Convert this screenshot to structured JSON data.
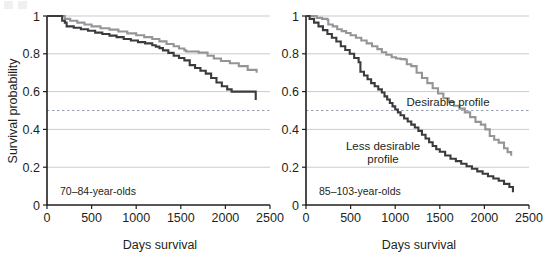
{
  "figure": {
    "title": "",
    "panels": [
      {
        "id": "left",
        "label": "70–84-year-olds",
        "xlabel": "Days survival",
        "ylabel": "Survival probability",
        "xticks": [
          "0",
          "500",
          "1000",
          "1500",
          "2000",
          "2500"
        ],
        "yticks": [
          "0",
          "0.2",
          "0.4",
          "0.6",
          "0.8",
          "1"
        ]
      },
      {
        "id": "right",
        "label": "85–103-year-olds",
        "xlabel": "Days survival",
        "ylabel": "",
        "xticks": [
          "0",
          "500",
          "1000",
          "1500",
          "2000",
          "2500"
        ],
        "yticks": [
          "0",
          "0.2",
          "0.4",
          "0.6",
          "0.8",
          "1"
        ],
        "annotations": [
          {
            "name": "desirable-profile-label",
            "text": "Desirable profile"
          },
          {
            "name": "less-desirable-profile-label-line1",
            "text": "Less desirable"
          },
          {
            "name": "less-desirable-profile-label-line2",
            "text": "profile"
          }
        ]
      }
    ],
    "colors": {
      "desirable": "#939598",
      "less_desirable": "#3b3b3d",
      "gridline": "#bcbec0",
      "reference_line": "#9aa2b1",
      "axis": "#231f20",
      "background": "#ffffff"
    },
    "reference_line_value": 0.5
  },
  "chart_data": [
    {
      "type": "line",
      "subtype": "kaplan-meier-step",
      "panel": "left",
      "title": "70–84-year-olds",
      "xlabel": "Days survival",
      "ylabel": "Survival probability",
      "xlim": [
        0,
        2500
      ],
      "ylim": [
        0,
        1
      ],
      "xticks": [
        0,
        500,
        1000,
        1500,
        2000,
        2500
      ],
      "yticks": [
        0,
        0.2,
        0.4,
        0.6,
        0.8,
        1
      ],
      "grid": "horizontal",
      "legend": "none",
      "reference_line": {
        "y": 0.5,
        "style": "dashed"
      },
      "series": [
        {
          "name": "Desirable profile",
          "color": "#939598",
          "x": [
            0,
            150,
            200,
            260,
            340,
            420,
            500,
            600,
            700,
            800,
            900,
            1000,
            1090,
            1180,
            1260,
            1340,
            1420,
            1480,
            1540,
            1560,
            1700,
            1800,
            1870,
            1950,
            2050,
            2150,
            2250,
            2350
          ],
          "y": [
            1.0,
            1.0,
            0.985,
            0.975,
            0.965,
            0.955,
            0.945,
            0.935,
            0.928,
            0.918,
            0.908,
            0.898,
            0.888,
            0.878,
            0.866,
            0.852,
            0.84,
            0.828,
            0.818,
            0.812,
            0.806,
            0.79,
            0.775,
            0.762,
            0.75,
            0.735,
            0.715,
            0.7
          ]
        },
        {
          "name": "Less desirable profile",
          "color": "#3b3b3d",
          "x": [
            0,
            140,
            170,
            200,
            220,
            300,
            380,
            460,
            540,
            620,
            700,
            780,
            860,
            940,
            1020,
            1100,
            1180,
            1220,
            1260,
            1300,
            1360,
            1420,
            1480,
            1540,
            1600,
            1660,
            1720,
            1780,
            1840,
            1900,
            1960,
            2020,
            2070,
            2300,
            2340
          ],
          "y": [
            1.0,
            1.0,
            0.975,
            0.965,
            0.945,
            0.938,
            0.93,
            0.922,
            0.912,
            0.905,
            0.896,
            0.888,
            0.878,
            0.87,
            0.862,
            0.855,
            0.845,
            0.838,
            0.83,
            0.818,
            0.805,
            0.79,
            0.778,
            0.765,
            0.74,
            0.725,
            0.71,
            0.695,
            0.672,
            0.648,
            0.628,
            0.612,
            0.6,
            0.6,
            0.555
          ]
        }
      ]
    },
    {
      "type": "line",
      "subtype": "kaplan-meier-step",
      "panel": "right",
      "title": "85–103-year-olds",
      "xlabel": "Days survival",
      "ylabel": "",
      "xlim": [
        0,
        2500
      ],
      "ylim": [
        0,
        1
      ],
      "xticks": [
        0,
        500,
        1000,
        1500,
        2000,
        2500
      ],
      "yticks": [
        0,
        0.2,
        0.4,
        0.6,
        0.8,
        1
      ],
      "grid": "horizontal",
      "legend": "inline-annotations",
      "reference_line": {
        "y": 0.5,
        "style": "dashed"
      },
      "series": [
        {
          "name": "Desirable profile",
          "color": "#939598",
          "x": [
            0,
            60,
            120,
            180,
            240,
            250,
            300,
            350,
            400,
            450,
            500,
            560,
            620,
            680,
            740,
            800,
            850,
            900,
            960,
            1010,
            1060,
            1110,
            1130,
            1180,
            1240,
            1300,
            1360,
            1420,
            1480,
            1540,
            1600,
            1660,
            1720,
            1780,
            1840,
            1900,
            1960,
            2010,
            2060,
            2110,
            2160,
            2220,
            2260,
            2300
          ],
          "y": [
            1.0,
            1.0,
            0.99,
            0.985,
            0.98,
            0.955,
            0.945,
            0.93,
            0.92,
            0.91,
            0.898,
            0.885,
            0.87,
            0.855,
            0.84,
            0.825,
            0.808,
            0.795,
            0.782,
            0.775,
            0.772,
            0.77,
            0.745,
            0.735,
            0.7,
            0.672,
            0.645,
            0.618,
            0.59,
            0.565,
            0.545,
            0.525,
            0.51,
            0.49,
            0.465,
            0.44,
            0.425,
            0.4,
            0.365,
            0.345,
            0.33,
            0.3,
            0.28,
            0.26
          ]
        },
        {
          "name": "Less desirable profile",
          "color": "#3b3b3d",
          "x": [
            0,
            40,
            90,
            140,
            190,
            240,
            290,
            340,
            390,
            440,
            490,
            540,
            590,
            610,
            650,
            690,
            730,
            770,
            810,
            850,
            880,
            910,
            940,
            970,
            1000,
            1030,
            1060,
            1100,
            1140,
            1180,
            1220,
            1260,
            1300,
            1340,
            1380,
            1420,
            1460,
            1500,
            1560,
            1620,
            1680,
            1740,
            1800,
            1860,
            1920,
            1980,
            2040,
            2100,
            2160,
            2220,
            2280,
            2320
          ],
          "y": [
            1.0,
            0.985,
            0.965,
            0.945,
            0.925,
            0.905,
            0.885,
            0.865,
            0.84,
            0.82,
            0.8,
            0.778,
            0.755,
            0.705,
            0.685,
            0.665,
            0.645,
            0.628,
            0.612,
            0.595,
            0.575,
            0.558,
            0.54,
            0.522,
            0.505,
            0.49,
            0.475,
            0.458,
            0.442,
            0.425,
            0.41,
            0.392,
            0.372,
            0.352,
            0.332,
            0.312,
            0.295,
            0.282,
            0.262,
            0.245,
            0.232,
            0.218,
            0.205,
            0.192,
            0.178,
            0.165,
            0.152,
            0.14,
            0.128,
            0.112,
            0.095,
            0.068
          ]
        }
      ]
    }
  ]
}
